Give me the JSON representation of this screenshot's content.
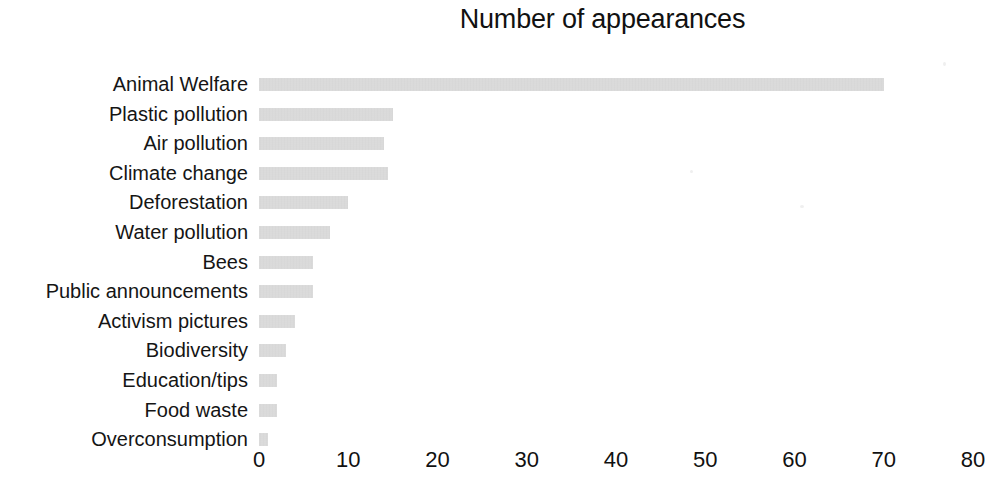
{
  "chart_data": {
    "type": "bar",
    "orientation": "horizontal",
    "title": "Number of appearances",
    "xlabel": "",
    "ylabel": "",
    "xlim": [
      0,
      80
    ],
    "xticks": [
      0,
      10,
      20,
      30,
      40,
      50,
      60,
      70,
      80
    ],
    "grid": false,
    "legend": null,
    "bar_color": "#d2d2d2",
    "categories": [
      "Animal Welfare",
      "Plastic pollution",
      "Air pollution",
      "Climate change",
      "Deforestation",
      "Water pollution",
      "Bees",
      "Public announcements",
      "Activism pictures",
      "Biodiversity",
      "Education/tips",
      "Food waste",
      "Overconsumption"
    ],
    "values": [
      70,
      15,
      14,
      14.5,
      10,
      8,
      6,
      6,
      4,
      3,
      2,
      2,
      1
    ]
  }
}
